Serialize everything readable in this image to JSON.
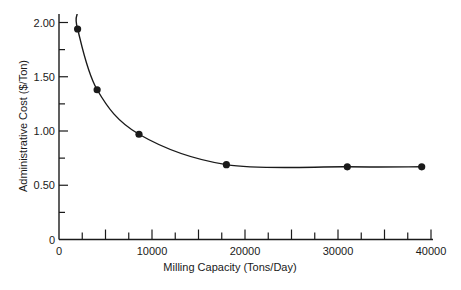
{
  "chart_data": {
    "type": "line",
    "title": "",
    "xlabel": "Milling Capacity (Tons/Day)",
    "ylabel": "Administrative Cost ($/Ton)",
    "xlim": [
      0,
      40000
    ],
    "ylim": [
      0,
      2.0
    ],
    "grid": false,
    "legend": null,
    "x_ticks": {
      "major": [
        0,
        10000,
        20000,
        30000,
        40000
      ],
      "major_labels": [
        "0",
        "10000",
        "20000",
        "30000",
        "40000"
      ],
      "all": [
        0,
        2500,
        5000,
        7500,
        10000,
        12500,
        15000,
        17500,
        20000,
        22500,
        25000,
        27500,
        30000,
        32500,
        35000,
        37500,
        40000
      ]
    },
    "y_ticks": {
      "major": [
        0,
        0.5,
        1.0,
        1.5,
        2.0
      ],
      "major_labels": [
        "0",
        "0.50",
        "1.00",
        "1.50",
        "2.00"
      ],
      "all": [
        0,
        0.25,
        0.5,
        0.75,
        1.0,
        1.25,
        1.5,
        1.75,
        2.0
      ]
    },
    "series": [
      {
        "name": "Administrative Cost",
        "style": "smooth curve with filled circle markers",
        "points": [
          {
            "x": 2000,
            "y": 1.94
          },
          {
            "x": 4100,
            "y": 1.38
          },
          {
            "x": 8600,
            "y": 0.97
          },
          {
            "x": 18000,
            "y": 0.69
          },
          {
            "x": 31000,
            "y": 0.67
          },
          {
            "x": 39000,
            "y": 0.67
          }
        ]
      }
    ],
    "colors": {
      "line": "#1a1a1a",
      "marker": "#1a1a1a",
      "axis": "#1a1a1a"
    }
  }
}
